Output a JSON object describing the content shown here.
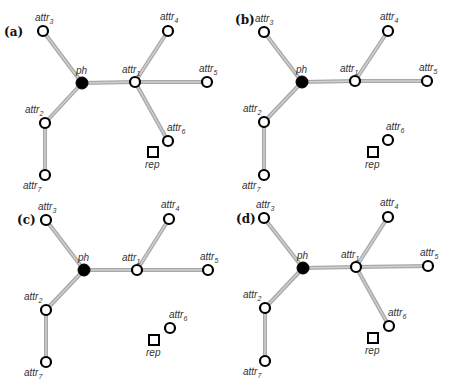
{
  "figure": {
    "panels": [
      {
        "label": "(a)",
        "label_pos": [
          4,
          36
        ],
        "nodes": {
          "ph": {
            "x": 82,
            "y": 83,
            "label": "ph",
            "sub": "",
            "lx": -6,
            "ly": -9
          },
          "attr1": {
            "x": 135,
            "y": 82,
            "label": "attr",
            "sub": "1",
            "lx": -13,
            "ly": -9
          },
          "attr2": {
            "x": 45,
            "y": 123,
            "label": "attr",
            "sub": "2",
            "lx": -20,
            "ly": -10
          },
          "attr3": {
            "x": 43,
            "y": 31,
            "label": "attr",
            "sub": "3",
            "lx": -8,
            "ly": -10
          },
          "attr4": {
            "x": 168,
            "y": 31,
            "label": "attr",
            "sub": "4",
            "lx": -8,
            "ly": -11
          },
          "attr5": {
            "x": 207,
            "y": 82,
            "label": "attr",
            "sub": "5",
            "lx": -8,
            "ly": -10
          },
          "attr6": {
            "x": 168,
            "y": 141,
            "label": "attr",
            "sub": "6",
            "lx": -1,
            "ly": -10
          },
          "attr7": {
            "x": 45,
            "y": 175,
            "label": "attr",
            "sub": "7",
            "lx": -22,
            "ly": 14
          }
        },
        "rep": {
          "x": 153,
          "y": 152,
          "label": "rep"
        },
        "edges": [
          [
            "ph",
            "attr1"
          ],
          [
            "ph",
            "attr3"
          ],
          [
            "ph",
            "attr2"
          ],
          [
            "attr2",
            "attr7"
          ],
          [
            "attr1",
            "attr4"
          ],
          [
            "attr1",
            "attr5"
          ],
          [
            "attr1",
            "attr6"
          ]
        ]
      },
      {
        "label": "(b)",
        "label_pos": [
          235,
          24
        ],
        "nodes": {
          "ph": {
            "x": 302,
            "y": 82,
            "label": "ph",
            "sub": "",
            "lx": -6,
            "ly": -9
          },
          "attr1": {
            "x": 355,
            "y": 81,
            "label": "attr",
            "sub": "1",
            "lx": -15,
            "ly": -9
          },
          "attr2": {
            "x": 264,
            "y": 122,
            "label": "attr",
            "sub": "2",
            "lx": -21,
            "ly": -10
          },
          "attr3": {
            "x": 264,
            "y": 32,
            "label": "attr",
            "sub": "3",
            "lx": -9,
            "ly": -10
          },
          "attr4": {
            "x": 388,
            "y": 31,
            "label": "attr",
            "sub": "4",
            "lx": -8,
            "ly": -11
          },
          "attr5": {
            "x": 427,
            "y": 81,
            "label": "attr",
            "sub": "5",
            "lx": -8,
            "ly": -10
          },
          "attr6": {
            "x": 388,
            "y": 140,
            "label": "attr",
            "sub": "6",
            "lx": -2,
            "ly": -10
          },
          "attr7": {
            "x": 264,
            "y": 175,
            "label": "attr",
            "sub": "7",
            "lx": -22,
            "ly": 14
          }
        },
        "rep": {
          "x": 373,
          "y": 152,
          "label": "rep"
        },
        "edges": [
          [
            "ph",
            "attr1"
          ],
          [
            "ph",
            "attr3"
          ],
          [
            "ph",
            "attr2"
          ],
          [
            "attr2",
            "attr7"
          ],
          [
            "attr1",
            "attr4"
          ],
          [
            "attr1",
            "attr5"
          ]
        ]
      },
      {
        "label": "(c)",
        "label_pos": [
          17,
          224
        ],
        "nodes": {
          "ph": {
            "x": 84,
            "y": 270,
            "label": "ph",
            "sub": "",
            "lx": -6,
            "ly": -9
          },
          "attr1": {
            "x": 137,
            "y": 270,
            "label": "attr",
            "sub": "1",
            "lx": -15,
            "ly": -9
          },
          "attr2": {
            "x": 46,
            "y": 310,
            "label": "attr",
            "sub": "2",
            "lx": -22,
            "ly": -10
          },
          "attr3": {
            "x": 46,
            "y": 220,
            "label": "attr",
            "sub": "3",
            "lx": -8,
            "ly": -10
          },
          "attr4": {
            "x": 169,
            "y": 219,
            "label": "attr",
            "sub": "4",
            "lx": -8,
            "ly": -11
          },
          "attr5": {
            "x": 208,
            "y": 270,
            "label": "attr",
            "sub": "5",
            "lx": -8,
            "ly": -10
          },
          "attr6": {
            "x": 170,
            "y": 328,
            "label": "attr",
            "sub": "6",
            "lx": -1,
            "ly": -10
          },
          "attr7": {
            "x": 46,
            "y": 362,
            "label": "attr",
            "sub": "7",
            "lx": -22,
            "ly": 14
          }
        },
        "rep": {
          "x": 154,
          "y": 340,
          "label": "rep"
        },
        "edges": [
          [
            "ph",
            "attr1"
          ],
          [
            "ph",
            "attr3"
          ],
          [
            "ph",
            "attr2"
          ],
          [
            "attr2",
            "attr7"
          ],
          [
            "attr1",
            "attr4"
          ],
          [
            "attr1",
            "attr5"
          ]
        ]
      },
      {
        "label": "(d)",
        "label_pos": [
          236,
          223
        ],
        "nodes": {
          "ph": {
            "x": 303,
            "y": 268,
            "label": "ph",
            "sub": "",
            "lx": -6,
            "ly": -9
          },
          "attr1": {
            "x": 356,
            "y": 267,
            "label": "attr",
            "sub": "1",
            "lx": -15,
            "ly": -9
          },
          "attr2": {
            "x": 265,
            "y": 308,
            "label": "attr",
            "sub": "2",
            "lx": -22,
            "ly": -10
          },
          "attr3": {
            "x": 264,
            "y": 218,
            "label": "attr",
            "sub": "3",
            "lx": -8,
            "ly": -10
          },
          "attr4": {
            "x": 388,
            "y": 217,
            "label": "attr",
            "sub": "4",
            "lx": -8,
            "ly": -11
          },
          "attr5": {
            "x": 428,
            "y": 266,
            "label": "attr",
            "sub": "5",
            "lx": -8,
            "ly": -10
          },
          "attr6": {
            "x": 389,
            "y": 326,
            "label": "attr",
            "sub": "6",
            "lx": -1,
            "ly": -10
          },
          "attr7": {
            "x": 265,
            "y": 361,
            "label": "attr",
            "sub": "7",
            "lx": -22,
            "ly": 14
          }
        },
        "rep": {
          "x": 373,
          "y": 338,
          "label": "rep"
        },
        "edges": [
          [
            "ph",
            "attr1"
          ],
          [
            "ph",
            "attr3"
          ],
          [
            "ph",
            "attr2"
          ],
          [
            "attr2",
            "attr7"
          ],
          [
            "attr1",
            "attr4"
          ],
          [
            "attr1",
            "attr5"
          ],
          [
            "attr1",
            "attr6"
          ]
        ]
      }
    ]
  },
  "colors": {
    "edge": "#a8a8a8",
    "edge_highlight": "#cfcfcf",
    "node_stroke": "#000000",
    "node_fill": "#ffffff",
    "ph_fill": "#000000"
  }
}
